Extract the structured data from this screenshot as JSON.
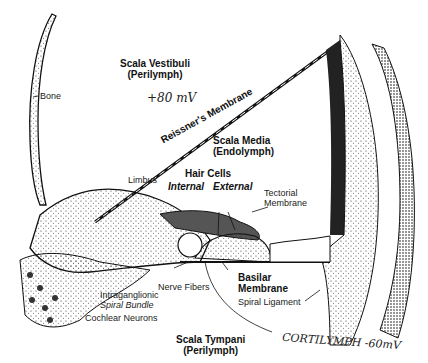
{
  "diagram": {
    "labels": {
      "scala_vestibuli": "Scala Vestibuli",
      "scala_vestibuli_fluid": "(Perilymph)",
      "sv_potential": "+80 mV",
      "bone": "Bone",
      "reissners_membrane": "Reissner's Membrane",
      "scala_media": "Scala Media",
      "scala_media_fluid": "(Endolymph)",
      "limbus": "Limbus",
      "hair_cells": "Hair Cells",
      "internal": "Internal",
      "external": "External",
      "tectorial_membrane_1": "Tectorial",
      "tectorial_membrane_2": "Membrane",
      "nerve_fibers": "Nerve Fibers",
      "basilar_membrane_1": "Basilar",
      "basilar_membrane_2": "Membrane",
      "intraganglionic": "Intraganglionic",
      "spiral_bundle": "Spiral Bundle",
      "cochlear_neurons": "Cochlear Neurons",
      "spiral_ligament": "Spiral Ligament",
      "scala_tympani": "Scala Tympani",
      "scala_tympani_fluid": "(Perilymph)",
      "cortilymph_note": "CORTILYMPH -60mV"
    }
  }
}
